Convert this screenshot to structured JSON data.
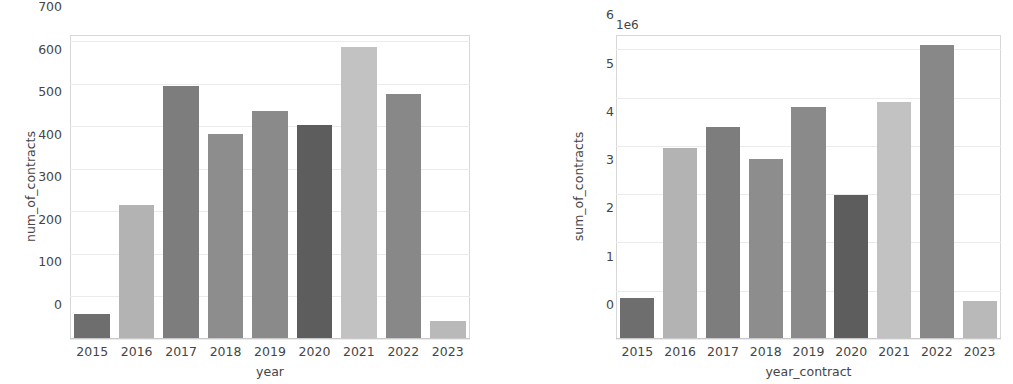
{
  "scan_artifact": {
    "top_cut_text": "of contracts by year and sum of contracts by year"
  },
  "figure": {
    "background": "#ffffff",
    "gridline_color": "#ebebeb",
    "tick_color": "#454545"
  },
  "chart_data": [
    {
      "id": "num-of-contracts-by-year",
      "type": "bar",
      "title": "",
      "xlabel": "year",
      "ylabel": "num_of_contracts",
      "categories": [
        "2015",
        "2016",
        "2017",
        "2018",
        "2019",
        "2020",
        "2021",
        "2022",
        "2023"
      ],
      "values": [
        57,
        312,
        592,
        481,
        535,
        500,
        684,
        574,
        40
      ],
      "bar_colors": [
        "#6e6e6e",
        "#b3b3b3",
        "#7d7d7d",
        "#8d8d8d",
        "#8a8a8a",
        "#5d5d5d",
        "#c2c2c2",
        "#888888",
        "#b9b9b9"
      ],
      "yticks": [
        0,
        100,
        200,
        300,
        400,
        500,
        600,
        700
      ],
      "ytick_labels": [
        "0",
        "100",
        "200",
        "300",
        "400",
        "500",
        "600",
        "700"
      ],
      "ylim": [
        0,
        715
      ],
      "grid": true,
      "legend": "none",
      "offset_text": ""
    },
    {
      "id": "sum-of-contracts-by-year-contract",
      "type": "bar",
      "title": "",
      "xlabel": "year_contract",
      "ylabel": "sum_of_contracts",
      "categories": [
        "2015",
        "2016",
        "2017",
        "2018",
        "2019",
        "2020",
        "2021",
        "2022",
        "2023"
      ],
      "values": [
        830000,
        3930000,
        4370000,
        3710000,
        4780000,
        2970000,
        4900000,
        6070000,
        770000
      ],
      "bar_colors": [
        "#6e6e6e",
        "#b3b3b3",
        "#7d7d7d",
        "#8d8d8d",
        "#8a8a8a",
        "#5d5d5d",
        "#c2c2c2",
        "#888888",
        "#b9b9b9"
      ],
      "yticks": [
        0,
        1000000,
        2000000,
        3000000,
        4000000,
        5000000,
        6000000
      ],
      "ytick_labels": [
        "0",
        "1",
        "2",
        "3",
        "4",
        "5",
        "6"
      ],
      "ylim": [
        0,
        6300000
      ],
      "grid": true,
      "legend": "none",
      "offset_text": "1e6"
    }
  ]
}
